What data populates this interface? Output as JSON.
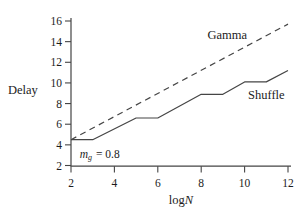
{
  "figure": {
    "background": "#ffffff",
    "line_color": "#454545",
    "text_color": "#1c1c1c"
  },
  "chart_data": {
    "type": "line",
    "title": "",
    "ylabel": "Delay",
    "xlabel": {
      "prefix": "log",
      "italic": "N"
    },
    "xlim": [
      2,
      12
    ],
    "ylim": [
      2,
      16
    ],
    "x_ticks": [
      2,
      4,
      6,
      8,
      10,
      12
    ],
    "y_ticks": [
      2,
      4,
      6,
      8,
      10,
      12,
      14,
      16
    ],
    "grid": false,
    "legend_position": "inline-labels",
    "annotation": {
      "var": "m",
      "sub": "g",
      "rest": "= 0.8",
      "x": 2.4,
      "y": 3.0
    },
    "series": [
      {
        "name": "Gamma",
        "style": "dashed",
        "x": [
          2,
          12
        ],
        "y": [
          4.5,
          15.7
        ],
        "label_x": 9.2,
        "label_y": 14.6
      },
      {
        "name": "Shuffle",
        "style": "solid",
        "x": [
          2,
          3,
          5,
          6,
          8,
          9,
          10,
          11,
          12
        ],
        "y": [
          4.5,
          4.5,
          6.6,
          6.6,
          8.9,
          8.9,
          10.1,
          10.1,
          11.2
        ],
        "label_x": 11.0,
        "label_y": 8.8
      }
    ]
  }
}
